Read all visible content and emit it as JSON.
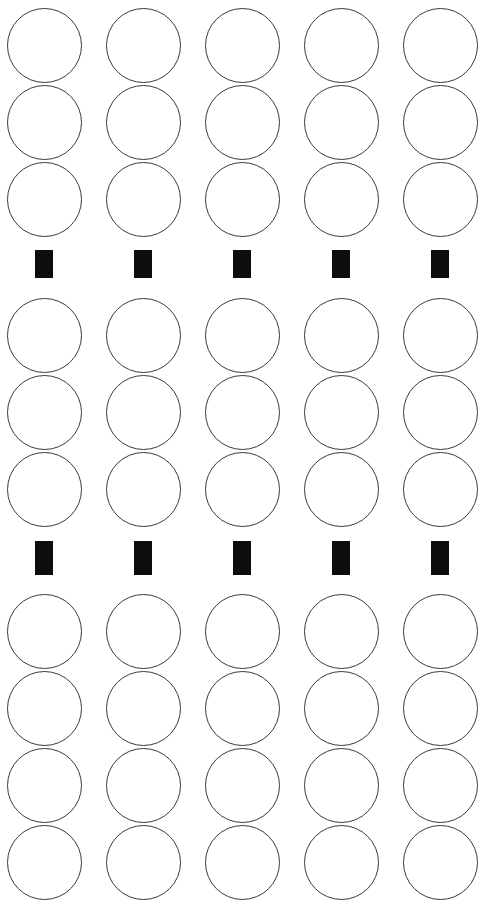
{
  "sheet": {
    "title": "Bubble Answer Sheet",
    "width": 489,
    "height": 911,
    "background_color": "#ffffff",
    "bubble_stroke_color": "#3a3a3a",
    "bubble_fill_color": "#ffffff",
    "mark_color": "#0d0d0d",
    "columns": 5,
    "column_centers_x": [
      44,
      143,
      242,
      341,
      440
    ],
    "column_pitch_x": 99,
    "bubble_diameter": 75,
    "row_pitch_y": 77
  },
  "groups": [
    {
      "name": "group-1",
      "rows": 3,
      "row_centers_y": [
        45,
        122,
        199
      ],
      "bubbles": [
        {
          "row": 1,
          "cells": [
            {
              "col": 1,
              "filled": false,
              "cx": 44,
              "cy": 45
            },
            {
              "col": 2,
              "filled": false,
              "cx": 143,
              "cy": 45
            },
            {
              "col": 3,
              "filled": false,
              "cx": 242,
              "cy": 45
            },
            {
              "col": 4,
              "filled": false,
              "cx": 341,
              "cy": 45
            },
            {
              "col": 5,
              "filled": false,
              "cx": 440,
              "cy": 45
            }
          ]
        },
        {
          "row": 2,
          "cells": [
            {
              "col": 1,
              "filled": false,
              "cx": 44,
              "cy": 122
            },
            {
              "col": 2,
              "filled": false,
              "cx": 143,
              "cy": 122
            },
            {
              "col": 3,
              "filled": false,
              "cx": 242,
              "cy": 122
            },
            {
              "col": 4,
              "filled": false,
              "cx": 341,
              "cy": 122
            },
            {
              "col": 5,
              "filled": false,
              "cx": 440,
              "cy": 122
            }
          ]
        },
        {
          "row": 3,
          "cells": [
            {
              "col": 1,
              "filled": false,
              "cx": 44,
              "cy": 199
            },
            {
              "col": 2,
              "filled": false,
              "cx": 143,
              "cy": 199
            },
            {
              "col": 3,
              "filled": false,
              "cx": 242,
              "cy": 199
            },
            {
              "col": 4,
              "filled": false,
              "cx": 341,
              "cy": 199
            },
            {
              "col": 5,
              "filled": false,
              "cx": 440,
              "cy": 199
            }
          ]
        }
      ]
    },
    {
      "name": "group-2",
      "rows": 3,
      "row_centers_y": [
        335,
        412,
        489
      ],
      "bubbles": [
        {
          "row": 1,
          "cells": [
            {
              "col": 1,
              "filled": false,
              "cx": 44,
              "cy": 335
            },
            {
              "col": 2,
              "filled": false,
              "cx": 143,
              "cy": 335
            },
            {
              "col": 3,
              "filled": false,
              "cx": 242,
              "cy": 335
            },
            {
              "col": 4,
              "filled": false,
              "cx": 341,
              "cy": 335
            },
            {
              "col": 5,
              "filled": false,
              "cx": 440,
              "cy": 335
            }
          ]
        },
        {
          "row": 2,
          "cells": [
            {
              "col": 1,
              "filled": false,
              "cx": 44,
              "cy": 412
            },
            {
              "col": 2,
              "filled": false,
              "cx": 143,
              "cy": 412
            },
            {
              "col": 3,
              "filled": false,
              "cx": 242,
              "cy": 412
            },
            {
              "col": 4,
              "filled": false,
              "cx": 341,
              "cy": 412
            },
            {
              "col": 5,
              "filled": false,
              "cx": 440,
              "cy": 412
            }
          ]
        },
        {
          "row": 3,
          "cells": [
            {
              "col": 1,
              "filled": false,
              "cx": 44,
              "cy": 489
            },
            {
              "col": 2,
              "filled": false,
              "cx": 143,
              "cy": 489
            },
            {
              "col": 3,
              "filled": false,
              "cx": 242,
              "cy": 489
            },
            {
              "col": 4,
              "filled": false,
              "cx": 341,
              "cy": 489
            },
            {
              "col": 5,
              "filled": false,
              "cx": 440,
              "cy": 489
            }
          ]
        }
      ]
    },
    {
      "name": "group-3",
      "rows": 4,
      "row_centers_y": [
        631,
        708,
        785,
        862
      ],
      "bubbles": [
        {
          "row": 1,
          "cells": [
            {
              "col": 1,
              "filled": false,
              "cx": 44,
              "cy": 631
            },
            {
              "col": 2,
              "filled": false,
              "cx": 143,
              "cy": 631
            },
            {
              "col": 3,
              "filled": false,
              "cx": 242,
              "cy": 631
            },
            {
              "col": 4,
              "filled": false,
              "cx": 341,
              "cy": 631
            },
            {
              "col": 5,
              "filled": false,
              "cx": 440,
              "cy": 631
            }
          ]
        },
        {
          "row": 2,
          "cells": [
            {
              "col": 1,
              "filled": false,
              "cx": 44,
              "cy": 708
            },
            {
              "col": 2,
              "filled": false,
              "cx": 143,
              "cy": 708
            },
            {
              "col": 3,
              "filled": false,
              "cx": 242,
              "cy": 708
            },
            {
              "col": 4,
              "filled": false,
              "cx": 341,
              "cy": 708
            },
            {
              "col": 5,
              "filled": false,
              "cx": 440,
              "cy": 708
            }
          ]
        },
        {
          "row": 3,
          "cells": [
            {
              "col": 1,
              "filled": false,
              "cx": 44,
              "cy": 785
            },
            {
              "col": 2,
              "filled": false,
              "cx": 143,
              "cy": 785
            },
            {
              "col": 3,
              "filled": false,
              "cx": 242,
              "cy": 785
            },
            {
              "col": 4,
              "filled": false,
              "cx": 341,
              "cy": 785
            },
            {
              "col": 5,
              "filled": false,
              "cx": 440,
              "cy": 785
            }
          ]
        },
        {
          "row": 4,
          "cells": [
            {
              "col": 1,
              "filled": false,
              "cx": 44,
              "cy": 862
            },
            {
              "col": 2,
              "filled": false,
              "cx": 143,
              "cy": 862
            },
            {
              "col": 3,
              "filled": false,
              "cx": 242,
              "cy": 862
            },
            {
              "col": 4,
              "filled": false,
              "cx": 341,
              "cy": 862
            },
            {
              "col": 5,
              "filled": false,
              "cx": 440,
              "cy": 862
            }
          ]
        }
      ]
    }
  ],
  "separators": [
    {
      "name": "separator-1",
      "y_top": 250,
      "mark_width": 18,
      "mark_height": 28,
      "marks": [
        {
          "col": 1,
          "x": 35,
          "y": 250
        },
        {
          "col": 2,
          "x": 134,
          "y": 250
        },
        {
          "col": 3,
          "x": 233,
          "y": 250
        },
        {
          "col": 4,
          "x": 332,
          "y": 250
        },
        {
          "col": 5,
          "x": 431,
          "y": 250
        }
      ]
    },
    {
      "name": "separator-2",
      "y_top": 541,
      "mark_width": 18,
      "mark_height": 34,
      "marks": [
        {
          "col": 1,
          "x": 35,
          "y": 541
        },
        {
          "col": 2,
          "x": 134,
          "y": 541
        },
        {
          "col": 3,
          "x": 233,
          "y": 541
        },
        {
          "col": 4,
          "x": 332,
          "y": 541
        },
        {
          "col": 5,
          "x": 431,
          "y": 541
        }
      ]
    }
  ]
}
